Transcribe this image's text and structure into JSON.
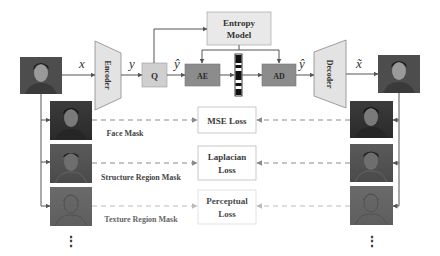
{
  "diagram": {
    "symbols": {
      "input": "x",
      "latent": "y",
      "quantized": "ŷ",
      "decoded_latent": "ŷ",
      "output": "x̃"
    },
    "blocks": {
      "encoder": "Encoder",
      "quantizer": "Q",
      "entropy_model_line1": "Entropy",
      "entropy_model_line2": "Model",
      "arithmetic_encoder": "AE",
      "arithmetic_decoder": "AD",
      "decoder": "Decoder"
    },
    "masks": [
      {
        "label": "Face Mask"
      },
      {
        "label": "Structure Region Mask"
      },
      {
        "label": "Texture Region Mask"
      }
    ],
    "losses": [
      {
        "line1": "MSE Loss",
        "line2": ""
      },
      {
        "line1": "Laplacian",
        "line2": "Loss"
      },
      {
        "line1": "Perceptual",
        "line2": "Loss"
      }
    ],
    "ellipsis": "⋮",
    "colors": {
      "encoder_fill": "#e3e3e3",
      "q_fill": "#cfcfcf",
      "ae_ad_fill": "#8c8c8c",
      "entropy_fill": "#e9e9e9",
      "arrow": "#555555",
      "dashed_dark": "#8a8a8a",
      "dashed_light": "#bbbbbb"
    }
  }
}
